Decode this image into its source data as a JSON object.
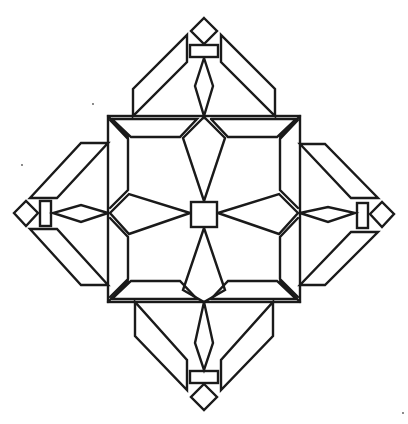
{
  "figure": {
    "title": "",
    "stroke_color": "#1a1a1a",
    "background_color": "#ffffff",
    "width": 408,
    "height": 424,
    "center": [
      204,
      213
    ],
    "central_square": {
      "x1": 108,
      "y1": 116,
      "x2": 300,
      "y2": 302
    },
    "center_square": {
      "x1": 191,
      "y1": 201,
      "x2": 217,
      "y2": 226
    },
    "arms": [
      "top",
      "right",
      "bottom",
      "left"
    ],
    "arm_parts": [
      "wing-left",
      "wing-right",
      "kite",
      "bar",
      "diamond"
    ]
  }
}
